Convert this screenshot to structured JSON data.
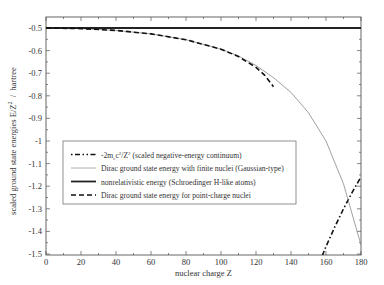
{
  "chart_data": {
    "type": "line",
    "title": "",
    "xlabel": "nuclear charge Z",
    "ylabel": "scaled ground state energies E/Z² / hartree",
    "xlim": [
      0,
      180
    ],
    "ylim": [
      -1.5,
      -0.5
    ],
    "xticks": [
      0,
      20,
      40,
      60,
      80,
      100,
      120,
      140,
      160,
      180
    ],
    "yticks": [
      -0.5,
      -0.6,
      -0.7,
      -0.8,
      -0.9,
      -1,
      -1.1,
      -1.2,
      -1.3,
      -1.4,
      -1.5
    ],
    "xtick_labels": [
      "0",
      "20",
      "40",
      "60",
      "80",
      "100",
      "120",
      "140",
      "160",
      "180"
    ],
    "ytick_labels": [
      "-0.5",
      "-0.6",
      "-0.7",
      "-0.8",
      "-0.9",
      "-1",
      "-1.1",
      "-1.2",
      "-1.3",
      "-1.4",
      "-1.5"
    ],
    "grid": false,
    "legend_position": "center-left",
    "series": [
      {
        "name": "-2mₑc²/Z² (scaled negative-energy continuum)",
        "style": "dash-dot",
        "x": [
          157,
          160,
          165,
          170,
          175,
          180
        ],
        "y": [
          -1.524,
          -1.467,
          -1.38,
          -1.3,
          -1.226,
          -1.159
        ]
      },
      {
        "name": "Dirac ground state energy with finite nuclei (Gaussian-type)",
        "style": "thin-solid",
        "x": [
          0,
          20,
          40,
          60,
          80,
          100,
          110,
          120,
          130,
          140,
          150,
          160,
          170,
          180
        ],
        "y": [
          -0.5,
          -0.5027,
          -0.5106,
          -0.5263,
          -0.5519,
          -0.5935,
          -0.624,
          -0.666,
          -0.72,
          -0.785,
          -0.875,
          -1.0,
          -1.19,
          -1.46
        ]
      },
      {
        "name": "nonrelativistic energy (Schroedinger H-like atoms)",
        "style": "thick-solid",
        "x": [
          0,
          180
        ],
        "y": [
          -0.5,
          -0.5
        ]
      },
      {
        "name": "Dirac ground state energy for point-charge nuclei",
        "style": "dashed",
        "x": [
          0,
          20,
          40,
          60,
          80,
          100,
          110,
          120,
          125,
          130
        ],
        "y": [
          -0.5,
          -0.5027,
          -0.5106,
          -0.5263,
          -0.5519,
          -0.594,
          -0.6265,
          -0.6743,
          -0.7093,
          -0.7596
        ]
      }
    ]
  },
  "legend": {
    "items": [
      {
        "prefix": "-2m",
        "sub": "e",
        "mid": "c",
        "sup1": "2",
        "mid2": "/Z",
        "sup2": "2",
        "rest": " (scaled negative-energy continuum)"
      },
      {
        "label": "Dirac ground state energy with finite nuclei (Gaussian-type)"
      },
      {
        "label": "nonrelativistic energy (Schroedinger H-like atoms)"
      },
      {
        "label": "Dirac ground state energy for point-charge nuclei"
      }
    ]
  },
  "axes": {
    "xlabel": "nuclear charge Z",
    "ylabel_main": "scaled ground state energies E/Z",
    "ylabel_sup": "2",
    "ylabel_unit": "  /  hartree"
  },
  "colors": {
    "axis": "#555555",
    "continuum": "#111111",
    "finite": "#888888",
    "nonrel": "#222222",
    "point": "#111111"
  }
}
